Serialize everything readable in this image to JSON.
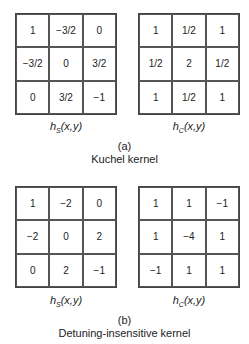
{
  "panels": [
    {
      "id": "a",
      "tag": "(a)",
      "title": "Kuchel kernel",
      "kernels": [
        {
          "func": "h",
          "sub": "S",
          "args": "(x,y)",
          "cells": [
            "1",
            "−3/2",
            "0",
            "−3/2",
            "0",
            "3/2",
            "0",
            "3/2",
            "−1"
          ]
        },
        {
          "func": "h",
          "sub": "C",
          "args": "(x,y)",
          "cells": [
            "1",
            "1/2",
            "1",
            "1/2",
            "2",
            "1/2",
            "1",
            "1/2",
            "1"
          ]
        }
      ]
    },
    {
      "id": "b",
      "tag": "(b)",
      "title": "Detuning-insensitive kernel",
      "kernels": [
        {
          "func": "h",
          "sub": "S",
          "args": "(x,y)",
          "cells": [
            "1",
            "−2",
            "0",
            "−2",
            "0",
            "2",
            "0",
            "2",
            "−1"
          ]
        },
        {
          "func": "h",
          "sub": "C",
          "args": "(x,y)",
          "cells": [
            "1",
            "1",
            "−1",
            "1",
            "−4",
            "1",
            "−1",
            "1",
            "1"
          ]
        }
      ]
    }
  ]
}
